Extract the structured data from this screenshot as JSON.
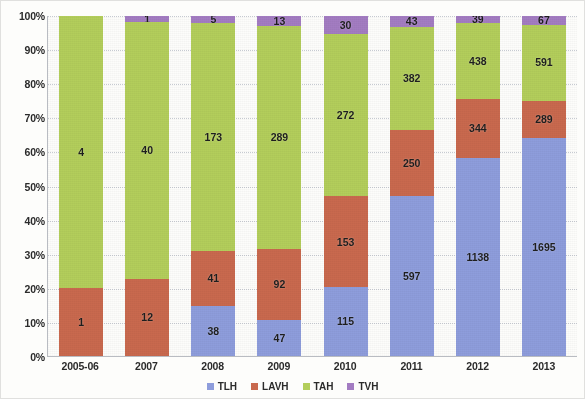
{
  "chart_data": {
    "type": "bar",
    "stacked": true,
    "normalized": true,
    "title": "",
    "subtitle": "",
    "xlabel": "",
    "ylabel": "",
    "ylim": [
      0,
      100
    ],
    "ytick_labels": [
      "100%",
      "90%",
      "80%",
      "70%",
      "60%",
      "50%",
      "40%",
      "30%",
      "20%",
      "10%",
      "0%"
    ],
    "ytick_values": [
      100,
      90,
      80,
      70,
      60,
      50,
      40,
      30,
      20,
      10,
      0
    ],
    "grid": true,
    "grid_axis": "y",
    "legend_position": "bottom",
    "categories": [
      "2005-06",
      "2007",
      "2008",
      "2009",
      "2010",
      "2011",
      "2012",
      "2013"
    ],
    "series": [
      {
        "name": "TLH",
        "color": "#8e9ddc",
        "values": [
          0,
          0,
          38,
          47,
          115,
          597,
          1138,
          1695
        ],
        "labels": [
          "",
          "",
          "38",
          "47",
          "115",
          "597",
          "1138",
          "1695"
        ]
      },
      {
        "name": "LAVH",
        "color": "#c9694e",
        "values": [
          1,
          12,
          41,
          92,
          153,
          250,
          344,
          289
        ],
        "labels": [
          "1",
          "12",
          "41",
          "92",
          "153",
          "250",
          "344",
          "289"
        ]
      },
      {
        "name": "TAH",
        "color": "#b3ce5b",
        "values": [
          4,
          40,
          173,
          289,
          272,
          382,
          438,
          591
        ],
        "labels": [
          "4",
          "40",
          "173",
          "289",
          "272",
          "382",
          "438",
          "591"
        ]
      },
      {
        "name": "TVH",
        "color": "#a37cc2",
        "values": [
          0,
          1,
          5,
          13,
          30,
          43,
          39,
          67
        ],
        "labels": [
          "",
          "1",
          "5",
          "13",
          "30",
          "43",
          "39",
          "67"
        ]
      }
    ],
    "column_totals": [
      5,
      53,
      257,
      441,
      570,
      1272,
      1959,
      2642
    ],
    "stack_order_bottom_to_top": [
      "TLH",
      "LAVH",
      "TAH",
      "TVH"
    ]
  },
  "legend": {
    "items": [
      {
        "label": "TLH",
        "color": "#8e9ddc"
      },
      {
        "label": "LAVH",
        "color": "#c9694e"
      },
      {
        "label": "TAH",
        "color": "#b3ce5b"
      },
      {
        "label": "TVH",
        "color": "#a37cc2"
      }
    ]
  }
}
